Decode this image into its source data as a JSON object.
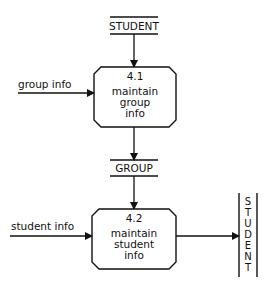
{
  "diagram": {
    "type": "data-flow-diagram",
    "data_stores": [
      {
        "id": "store-student-top",
        "label": "STUDENT"
      },
      {
        "id": "store-group",
        "label": "GROUP"
      },
      {
        "id": "store-student-right",
        "label": "STUDENT",
        "letters": [
          "S",
          "T",
          "U",
          "D",
          "E",
          "N",
          "T"
        ]
      }
    ],
    "processes": [
      {
        "id": "p41",
        "number": "4.1",
        "line1": "maintain",
        "line2": "group",
        "line3": "info"
      },
      {
        "id": "p42",
        "number": "4.2",
        "line1": "maintain",
        "line2": "student",
        "line3": "info"
      }
    ],
    "flows": [
      {
        "id": "f1",
        "label": "group info"
      },
      {
        "id": "f2",
        "label": "student info"
      }
    ]
  }
}
